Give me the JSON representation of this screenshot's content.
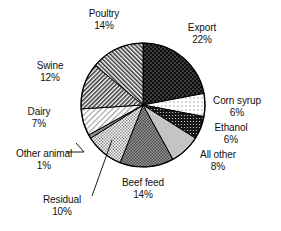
{
  "chart_data": {
    "type": "pie",
    "title": "",
    "subtitle": "",
    "xlabel": "",
    "ylabel": "",
    "legend_position": "none",
    "grid": false,
    "start_angle_deg": 0,
    "direction": "clockwise",
    "units": "percent",
    "total": 100,
    "categories": [
      "Export",
      "Corn syrup",
      "Ethanol",
      "All other",
      "Beef feed",
      "Residual",
      "Other animal",
      "Dairy",
      "Swine",
      "Poultry"
    ],
    "values": [
      22,
      6,
      6,
      8,
      14,
      10,
      1,
      7,
      12,
      14
    ],
    "slices": [
      {
        "label": "Export",
        "value": 22,
        "percent_text": "22%",
        "pattern": "black-with-white-dots",
        "fill": "#0d0d0d",
        "leader_line": false
      },
      {
        "label": "Corn syrup",
        "value": 6,
        "percent_text": "6%",
        "pattern": "white-with-fine-dot-grid",
        "fill": "#fbfbfb",
        "leader_line": false
      },
      {
        "label": "Ethanol",
        "value": 6,
        "percent_text": "6%",
        "pattern": "dark-dense-dots",
        "fill": "#1a1a1a",
        "leader_line": false
      },
      {
        "label": "All other",
        "value": 8,
        "percent_text": "8%",
        "pattern": "light-gray-solid",
        "fill": "#c2c2c2",
        "leader_line": false
      },
      {
        "label": "Beef feed",
        "value": 14,
        "percent_text": "14%",
        "pattern": "medium-dark-checkerboard",
        "fill": "#5e5e5e",
        "leader_line": false
      },
      {
        "label": "Residual",
        "value": 10,
        "percent_text": "10%",
        "pattern": "light-checkerboard",
        "fill": "#a8a8a8",
        "leader_line": true
      },
      {
        "label": "Other animal",
        "value": 1,
        "percent_text": "1%",
        "pattern": "thin-sliver-gray",
        "fill": "#8a8a8a",
        "leader_line": true
      },
      {
        "label": "Dairy",
        "value": 7,
        "percent_text": "7%",
        "pattern": "light-diagonal-hatch",
        "fill": "#efefef",
        "leader_line": false
      },
      {
        "label": "Swine",
        "value": 12,
        "percent_text": "12%",
        "pattern": "dense-diagonal-hatch-right",
        "fill": "#707070",
        "leader_line": false
      },
      {
        "label": "Poultry",
        "value": 14,
        "percent_text": "14%",
        "pattern": "dense-diagonal-hatch-left",
        "fill": "#6a6a6a",
        "leader_line": false
      }
    ]
  },
  "labels": {
    "export": {
      "name": "Export",
      "pct": "22%"
    },
    "corn_syrup": {
      "name": "Corn syrup",
      "pct": "6%"
    },
    "ethanol": {
      "name": "Ethanol",
      "pct": "6%"
    },
    "all_other": {
      "name": "All other",
      "pct": "8%"
    },
    "beef_feed": {
      "name": "Beef feed",
      "pct": "14%"
    },
    "residual": {
      "name": "Residual",
      "pct": "10%"
    },
    "other_animal": {
      "name": "Other animal",
      "pct": "1%"
    },
    "dairy": {
      "name": "Dairy",
      "pct": "7%"
    },
    "swine": {
      "name": "Swine",
      "pct": "12%"
    },
    "poultry": {
      "name": "Poultry",
      "pct": "14%"
    }
  },
  "colors": {
    "background": "#ffffff",
    "outline": "#000000",
    "text": "#111111"
  }
}
